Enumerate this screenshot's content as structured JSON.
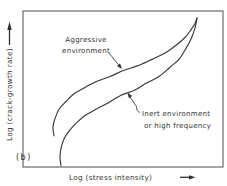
{
  "figure": {
    "panel_label": "(b)",
    "x_axis_label": "Log (stress intensity)",
    "y_axis_label": "Log (crack-growth rate)",
    "annotations": {
      "aggressive": {
        "line1": "Aggressive",
        "line2": "environment"
      },
      "inert": {
        "line1": "Inert environment",
        "line2": "or high frequency"
      }
    },
    "colors": {
      "stroke": "#383838",
      "text": "#333333",
      "background": "#ffffff"
    }
  },
  "chart_data": {
    "type": "line",
    "title": "",
    "xlabel": "Log (stress intensity)",
    "ylabel": "Log (crack-growth rate)",
    "panel": "(b)",
    "axes": {
      "scale": "log-log schematic, no numeric ticks",
      "x_arrow_direction": "right",
      "y_arrow_direction": "up",
      "grid": false,
      "legend_position": "inline annotations with leader arrows"
    },
    "series": [
      {
        "name": "Aggressive environment",
        "role": "upper-curve",
        "points_normalized": [
          [
            0.155,
            0.2
          ],
          [
            0.15,
            0.26
          ],
          [
            0.16,
            0.31
          ],
          [
            0.18,
            0.37
          ],
          [
            0.215,
            0.42
          ],
          [
            0.255,
            0.47
          ],
          [
            0.31,
            0.51
          ],
          [
            0.37,
            0.55
          ],
          [
            0.435,
            0.58
          ],
          [
            0.505,
            0.62
          ],
          [
            0.575,
            0.65
          ],
          [
            0.645,
            0.69
          ],
          [
            0.71,
            0.73
          ],
          [
            0.765,
            0.78
          ],
          [
            0.81,
            0.83
          ],
          [
            0.84,
            0.88
          ],
          [
            0.86,
            0.92
          ],
          [
            0.87,
            0.955
          ]
        ]
      },
      {
        "name": "Inert environment or high frequency",
        "role": "lower-curve",
        "points_normalized": [
          [
            0.19,
            0.01
          ],
          [
            0.185,
            0.06
          ],
          [
            0.19,
            0.12
          ],
          [
            0.205,
            0.18
          ],
          [
            0.23,
            0.23
          ],
          [
            0.265,
            0.28
          ],
          [
            0.31,
            0.33
          ],
          [
            0.365,
            0.37
          ],
          [
            0.425,
            0.41
          ],
          [
            0.49,
            0.46
          ],
          [
            0.555,
            0.49
          ],
          [
            0.62,
            0.54
          ],
          [
            0.68,
            0.58
          ],
          [
            0.735,
            0.64
          ],
          [
            0.78,
            0.69
          ],
          [
            0.815,
            0.76
          ],
          [
            0.84,
            0.82
          ],
          [
            0.86,
            0.89
          ],
          [
            0.87,
            0.955
          ]
        ]
      }
    ]
  }
}
